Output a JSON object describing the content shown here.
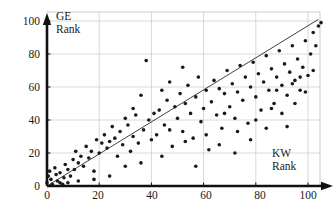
{
  "chart_data": {
    "type": "scatter",
    "title": "",
    "subtitle": "",
    "xlabel": "KW Rank",
    "ylabel": "GE Rank",
    "xlim": [
      0,
      107
    ],
    "ylim": [
      0,
      104
    ],
    "xticks": [
      0,
      20,
      40,
      60,
      80,
      100
    ],
    "yticks": [
      0,
      20,
      40,
      60,
      80,
      100
    ],
    "grid": true,
    "legend": null,
    "annotations": [],
    "axis_style": "arrow-tipped thick axes with light gray gridlines and thin plot border",
    "marker": {
      "shape": "circle",
      "size_px": 2.6,
      "color": "#1a1a1a"
    },
    "fit_line": {
      "type": "line",
      "description": "least-squares / identity trend line",
      "x_start": 0,
      "y_start": 0,
      "x_end": 104,
      "y_end": 101,
      "color": "#2b2b2b",
      "width_px": 0.9
    },
    "points": [
      [
        0,
        2
      ],
      [
        0.5,
        6
      ],
      [
        1,
        9
      ],
      [
        1.5,
        4
      ],
      [
        2,
        1
      ],
      [
        3,
        11
      ],
      [
        3.5,
        7
      ],
      [
        4,
        3
      ],
      [
        5,
        8
      ],
      [
        6,
        1
      ],
      [
        6.5,
        5
      ],
      [
        7,
        13
      ],
      [
        8,
        2
      ],
      [
        9,
        6
      ],
      [
        10,
        16
      ],
      [
        10.5,
        10
      ],
      [
        11,
        21
      ],
      [
        12,
        14
      ],
      [
        13,
        18
      ],
      [
        14,
        12
      ],
      [
        15,
        24
      ],
      [
        16,
        17
      ],
      [
        17,
        21
      ],
      [
        18,
        9
      ],
      [
        19,
        28
      ],
      [
        20,
        20
      ],
      [
        21,
        26
      ],
      [
        22,
        31
      ],
      [
        23,
        23
      ],
      [
        24,
        27
      ],
      [
        25,
        36
      ],
      [
        26,
        29
      ],
      [
        27,
        18
      ],
      [
        28,
        33
      ],
      [
        29,
        25
      ],
      [
        30,
        12
      ],
      [
        31,
        37
      ],
      [
        32,
        21
      ],
      [
        33,
        30
      ],
      [
        34,
        43
      ],
      [
        35,
        26
      ],
      [
        36,
        55
      ],
      [
        37,
        34
      ],
      [
        38,
        76
      ],
      [
        39,
        40
      ],
      [
        40,
        28
      ],
      [
        41,
        44
      ],
      [
        42,
        31
      ],
      [
        43,
        46
      ],
      [
        44,
        58
      ],
      [
        45,
        37
      ],
      [
        46,
        52
      ],
      [
        47,
        63
      ],
      [
        48,
        24
      ],
      [
        49,
        48
      ],
      [
        50,
        41
      ],
      [
        51,
        56
      ],
      [
        52,
        33
      ],
      [
        53,
        50
      ],
      [
        54,
        61
      ],
      [
        55,
        44
      ],
      [
        56,
        29
      ],
      [
        57,
        54
      ],
      [
        58,
        66
      ],
      [
        59,
        39
      ],
      [
        60,
        47
      ],
      [
        61,
        58
      ],
      [
        62,
        22
      ],
      [
        63,
        51
      ],
      [
        64,
        64
      ],
      [
        65,
        43
      ],
      [
        66,
        59
      ],
      [
        67,
        35
      ],
      [
        68,
        56
      ],
      [
        69,
        70
      ],
      [
        70,
        48
      ],
      [
        71,
        62
      ],
      [
        72,
        41
      ],
      [
        73,
        57
      ],
      [
        74,
        73
      ],
      [
        75,
        52
      ],
      [
        76,
        66
      ],
      [
        77,
        38
      ],
      [
        78,
        60
      ],
      [
        79,
        75
      ],
      [
        80,
        54
      ],
      [
        81,
        68
      ],
      [
        82,
        46
      ],
      [
        83,
        63
      ],
      [
        84,
        79
      ],
      [
        85,
        58
      ],
      [
        86,
        71
      ],
      [
        87,
        50
      ],
      [
        88,
        66
      ],
      [
        89,
        82
      ],
      [
        90,
        61
      ],
      [
        91,
        74
      ],
      [
        92,
        55
      ],
      [
        93,
        69
      ],
      [
        94,
        85
      ],
      [
        95,
        64
      ],
      [
        96,
        77
      ],
      [
        97,
        58
      ],
      [
        98,
        72
      ],
      [
        99,
        88
      ],
      [
        100,
        67
      ],
      [
        101,
        80
      ],
      [
        102,
        93
      ],
      [
        103,
        85
      ],
      [
        104,
        97
      ],
      [
        105,
        99
      ],
      [
        33,
        47
      ],
      [
        44,
        18
      ],
      [
        52,
        72
      ],
      [
        57,
        12
      ],
      [
        61,
        31
      ],
      [
        66,
        25
      ],
      [
        72,
        20
      ],
      [
        78,
        28
      ],
      [
        84,
        35
      ],
      [
        90,
        44
      ],
      [
        95,
        50
      ],
      [
        99,
        57
      ],
      [
        24,
        6
      ],
      [
        30,
        41
      ],
      [
        36,
        14
      ],
      [
        47,
        34
      ],
      [
        53,
        27
      ],
      [
        68,
        44
      ],
      [
        73,
        33
      ],
      [
        80,
        40
      ],
      [
        86,
        47
      ],
      [
        92,
        36
      ],
      [
        97,
        66
      ],
      [
        102,
        70
      ],
      [
        18,
        4
      ],
      [
        12,
        3
      ],
      [
        8,
        10
      ],
      [
        5,
        2
      ],
      [
        88,
        58
      ],
      [
        94,
        62
      ]
    ]
  },
  "axis_labels": {
    "x": [
      "0",
      "20",
      "40",
      "60",
      "80",
      "100"
    ],
    "y": [
      "0",
      "20",
      "40",
      "60",
      "80",
      "100"
    ]
  },
  "axis_titles": {
    "y_line1": "GE",
    "y_line2": "Rank",
    "x_line1": "KW",
    "x_line2": "Rank"
  },
  "colors": {
    "marker": "#1a1a1a",
    "axis": "#111111",
    "grid": "#c9c9c9",
    "border": "#b4b4b4",
    "fit_line": "#2b2b2b",
    "background": "#ffffff"
  }
}
